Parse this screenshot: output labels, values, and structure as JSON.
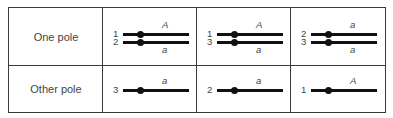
{
  "rows": [
    {
      "label": "One pole"
    },
    {
      "label": "Other pole"
    }
  ],
  "cells": [
    {
      "row": 0,
      "col": 0,
      "chromosomes": [
        {
          "num": "1",
          "allele": "A",
          "allele_pos": "above"
        },
        {
          "num": "2",
          "allele": "a",
          "allele_pos": "below"
        }
      ]
    },
    {
      "row": 0,
      "col": 1,
      "chromosomes": [
        {
          "num": "1",
          "allele": "A",
          "allele_pos": "above"
        },
        {
          "num": "3",
          "allele": "a",
          "allele_pos": "below"
        }
      ]
    },
    {
      "row": 0,
      "col": 2,
      "chromosomes": [
        {
          "num": "2",
          "allele": "a",
          "allele_pos": "above"
        },
        {
          "num": "3",
          "allele": "a",
          "allele_pos": "below"
        }
      ]
    },
    {
      "row": 1,
      "col": 0,
      "chromosomes": [
        {
          "num": "3",
          "allele": "a",
          "allele_pos": "above"
        }
      ]
    },
    {
      "row": 1,
      "col": 1,
      "chromosomes": [
        {
          "num": "2",
          "allele": "a",
          "allele_pos": "above"
        }
      ]
    },
    {
      "row": 1,
      "col": 2,
      "chromosomes": [
        {
          "num": "1",
          "allele": "A",
          "allele_pos": "above"
        }
      ]
    }
  ],
  "colors": {
    "line": "#111111",
    "border": "#3a3a3a",
    "text": "#444444"
  }
}
